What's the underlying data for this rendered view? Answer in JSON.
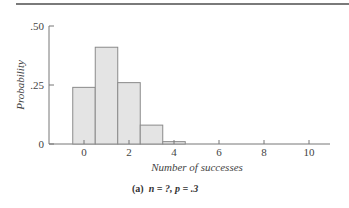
{
  "chart_data": {
    "type": "bar",
    "title": "",
    "caption": "(a) n = ?, p = .3",
    "caption_prefix": "(a)",
    "caption_n": "n = ?,",
    "caption_p": "p = .3",
    "xlabel": "Number of successes",
    "ylabel": "Probability",
    "categories": [
      "0",
      "1",
      "2",
      "3",
      "4"
    ],
    "x": [
      0,
      1,
      2,
      3,
      4
    ],
    "values": [
      0.24,
      0.41,
      0.26,
      0.08,
      0.01
    ],
    "xlim": [
      -1,
      11
    ],
    "ylim": [
      0,
      0.5
    ],
    "xticks": [
      "0",
      "2",
      "4",
      "6",
      "8",
      "10"
    ],
    "yticks": [
      "0",
      ".25",
      ".50"
    ],
    "grid": false,
    "legend": null,
    "colors": {
      "bar_fill": "#e4e4e4",
      "bar_edge": "#8a8a8a",
      "axis": "#777777"
    }
  }
}
